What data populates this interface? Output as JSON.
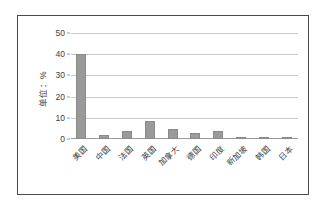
{
  "chart_data": {
    "type": "bar",
    "title": "",
    "xlabel": "",
    "ylabel": "单位：%",
    "ylim": [
      0,
      50
    ],
    "ytick_labels": [
      "0",
      "10",
      "20",
      "30",
      "40",
      "50"
    ],
    "ytick_values": [
      0,
      10,
      20,
      30,
      40,
      50
    ],
    "grid": true,
    "legend": "none",
    "categories": [
      "美国",
      "中国",
      "法国",
      "英国",
      "加拿大",
      "德国",
      "印度",
      "新加坡",
      "韩国",
      "日本"
    ],
    "values": [
      40,
      2,
      4,
      8.7,
      4.8,
      3,
      3.7,
      1,
      0.5,
      0.4
    ],
    "series": [
      {
        "name": "占比",
        "values": [
          40,
          2,
          4,
          8.7,
          4.8,
          3,
          3.7,
          1,
          0.5,
          0.4
        ]
      }
    ],
    "colors": {
      "bar": "#9a9a9a",
      "bar_border": "#8a8a8a",
      "gridline": "#c8c8c8",
      "axis": "#9b9b9b",
      "text": "#3d3d3d",
      "frame": "#4a4a4a",
      "background": "#ffffff"
    }
  }
}
